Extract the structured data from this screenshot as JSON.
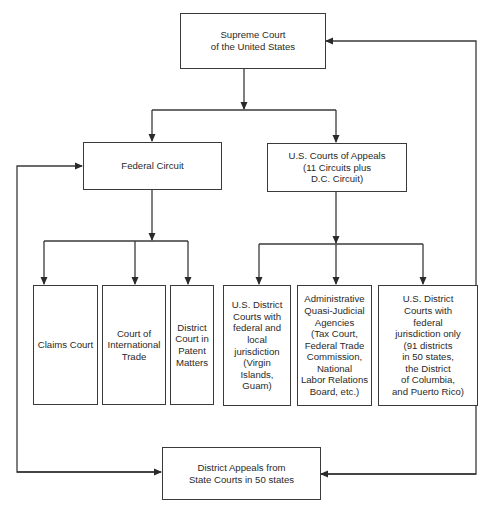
{
  "diagram": {
    "nodes": {
      "supreme_court": "Supreme Court\nof the United States",
      "federal_circuit": "Federal Circuit",
      "courts_of_appeals": "U.S. Courts of Appeals\n(11 Circuits plus\nD.C. Circuit)",
      "claims_court": "Claims Court",
      "international_trade": "Court of\nInternational\nTrade",
      "patent_matters": "District\nCourt in\nPatent\nMatters",
      "district_federal_local": "U.S. District\nCourts with\nfederal and\nlocal\njurisdiction\n(Virgin Islands,\nGuam)",
      "administrative_agencies": "Administrative\nQuasi-Judicial\nAgencies\n(Tax Court,\nFederal Trade\nCommission,\nNational\nLabor Relations\nBoard, etc.)",
      "district_federal_only": "U.S. District\nCourts with\nfederal\njurisdiction only\n(91 districts\nin 50 states,\nthe District\nof Columbia,\nand Puerto Rico)",
      "state_appeals": "District Appeals from\nState Courts in 50 states"
    },
    "edges": [
      {
        "from": "supreme_court",
        "to": "federal_circuit"
      },
      {
        "from": "supreme_court",
        "to": "courts_of_appeals"
      },
      {
        "from": "federal_circuit",
        "to": "claims_court"
      },
      {
        "from": "federal_circuit",
        "to": "international_trade"
      },
      {
        "from": "federal_circuit",
        "to": "patent_matters"
      },
      {
        "from": "courts_of_appeals",
        "to": "district_federal_local"
      },
      {
        "from": "courts_of_appeals",
        "to": "administrative_agencies"
      },
      {
        "from": "courts_of_appeals",
        "to": "district_federal_only"
      },
      {
        "from": "federal_circuit",
        "to": "state_appeals",
        "bidirectional": true
      },
      {
        "from": "supreme_court",
        "to": "state_appeals",
        "bidirectional": true
      }
    ],
    "colors": {
      "line": "#3a3a3a",
      "background": "#ffffff",
      "text": "#2a2a2a"
    }
  }
}
